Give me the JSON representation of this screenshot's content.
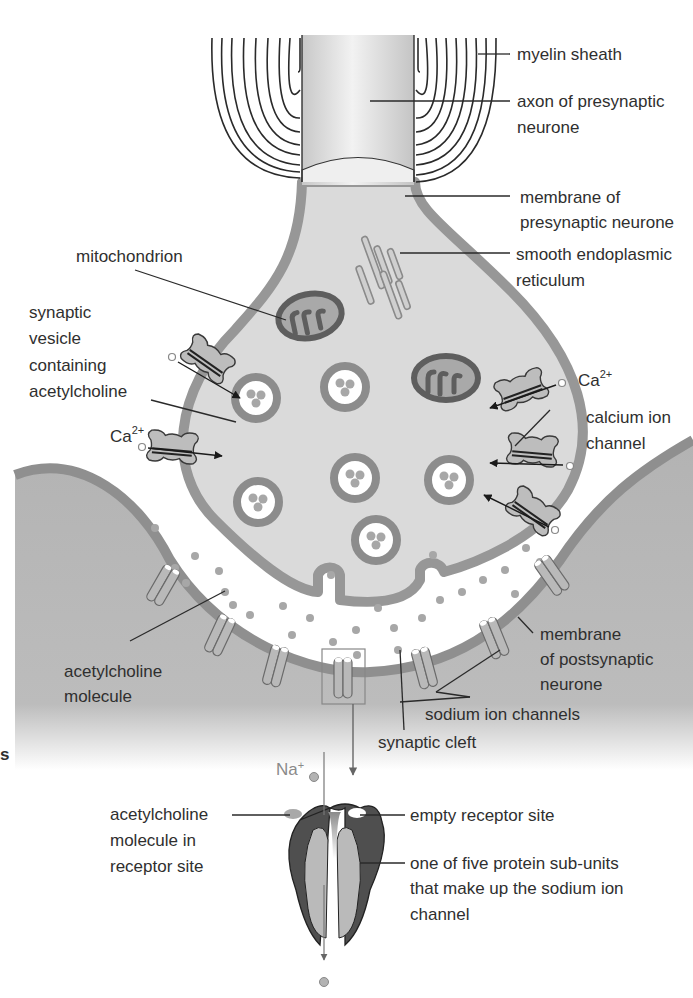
{
  "figure": {
    "colors": {
      "background": "#ffffff",
      "cytoplasm": "#d9d9d9",
      "membrane": "#9a9a9a",
      "postsynaptic": "#b5b5b5",
      "organelle_dark": "#6a6a6a",
      "text": "#2f2f2f",
      "na_label": "#8a8a8a"
    }
  },
  "labels": {
    "myelin_sheath": "myelin sheath",
    "axon_line1": "axon of presynaptic",
    "axon_line2": "neurone",
    "membrane_pre_line1": "membrane of",
    "membrane_pre_line2": "presynaptic neurone",
    "ser_line1": "smooth endoplasmic",
    "ser_line2": "reticulum",
    "mitochondrion": "mitochondrion",
    "vesicle_line1": "synaptic",
    "vesicle_line2": "vesicle",
    "vesicle_line3": "containing",
    "vesicle_line4": "acetylcholine",
    "ca_left_base": "Ca",
    "ca_left_sup": "2+",
    "ca_right_base": "Ca",
    "ca_right_sup": "2+",
    "calcium_channel_line1": "calcium ion",
    "calcium_channel_line2": "channel",
    "ach_molecule_line1": "acetylcholine",
    "ach_molecule_line2": "molecule",
    "membrane_post_line1": "membrane",
    "membrane_post_line2": "of postsynaptic",
    "membrane_post_line3": "neurone",
    "sodium_channels": "sodium ion channels",
    "synaptic_cleft": "synaptic cleft",
    "na_base": "Na",
    "na_sup": "+",
    "ach_in_site_line1": "acetylcholine",
    "ach_in_site_line2": "molecule in",
    "ach_in_site_line3": "receptor site",
    "empty_site": "empty receptor site",
    "subunit_line1": "one of five protein sub-units",
    "subunit_line2": "that make up the sodium ion",
    "subunit_line3": "channel",
    "edge_fragment": "s"
  }
}
